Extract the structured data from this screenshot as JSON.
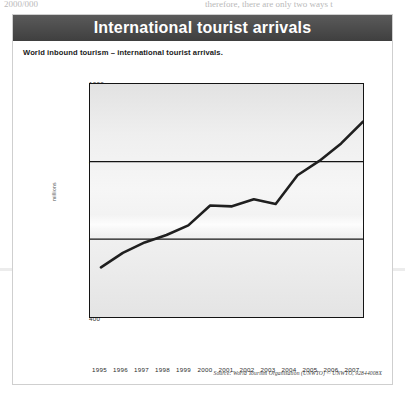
{
  "page": {
    "top_text_left": "2000/000",
    "top_text_right": "therefore, there are only two ways t"
  },
  "figure": {
    "title": "International tourist arrivals",
    "subtitle": "World inbound tourism – international tourist arrivals.",
    "source": "Source: World Tourism Organisation (UNWTO) © UNWTO, 92844008X"
  },
  "chart_data": {
    "type": "line",
    "title": "International tourist arrivals",
    "subtitle": "World inbound tourism – international tourist arrivals.",
    "xlabel": "",
    "ylabel": "millions",
    "x": [
      "1995",
      "1996",
      "1997",
      "1998",
      "1999",
      "2000",
      "2001",
      "2002",
      "2003",
      "2004",
      "2005",
      "2006",
      "2007"
    ],
    "categories": [
      "1995",
      "1996",
      "1997",
      "1998",
      "1999",
      "2000",
      "2001",
      "2002",
      "2003",
      "2004",
      "2005",
      "2006",
      "2007"
    ],
    "values": [
      528,
      565,
      592,
      611,
      636,
      687,
      685,
      703,
      691,
      765,
      802,
      847,
      903
    ],
    "series": [
      {
        "name": "International tourist arrivals",
        "values": [
          528,
          565,
          592,
          611,
          636,
          687,
          685,
          703,
          691,
          765,
          802,
          847,
          903
        ]
      }
    ],
    "ylim": [
      400,
      1000
    ],
    "yticks": [
      400,
      600,
      800,
      1000
    ],
    "ytick_labels": [
      "400",
      "600",
      "800",
      "1000"
    ],
    "grid": true,
    "gridlines_y": [
      600,
      800
    ],
    "legend": false,
    "line_color": "#1f1f1f",
    "plot_background": "#efefef"
  },
  "colors": {
    "title_bar": "#4a4a4a",
    "title_text": "#ffffff",
    "axis": "#141414",
    "line": "#1f1f1f",
    "text": "#1a1a1a"
  }
}
